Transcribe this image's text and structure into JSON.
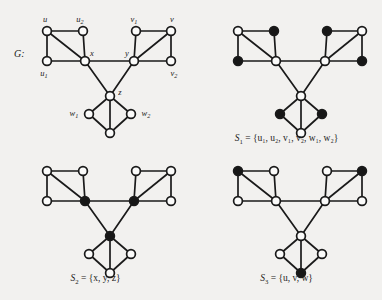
{
  "figure": {
    "background_color": "#f2f1ef",
    "ink_color": "#1a1a1a",
    "open_node_color": "#fbfbfa",
    "filled_node_color": "#171717"
  },
  "panels": {
    "G": {
      "label": "G:",
      "vertex_labels": {
        "u": "u",
        "u1_base": "u",
        "u1_sub": "1",
        "u2_base": "u",
        "u2_sub": "2",
        "v": "v",
        "v1_base": "v",
        "v1_sub": "1",
        "v2_base": "v",
        "v2_sub": "2",
        "x": "x",
        "y": "y",
        "z": "z",
        "w": "w",
        "w1_base": "w",
        "w1_sub": "1",
        "w2_base": "w",
        "w2_sub": "2"
      },
      "filled_vertices": []
    },
    "S1": {
      "caption_name": "S",
      "caption_sub": "1",
      "caption_set": " = {u₁, u₂, v₁, v₂, w₁, w₂}",
      "caption_plain": "S1 = {u1, u2, v1, v2, w1, w2}",
      "filled_vertices": [
        "u1",
        "u2",
        "v1",
        "v2",
        "w1",
        "w2"
      ]
    },
    "S2": {
      "caption_name": "S",
      "caption_sub": "2",
      "caption_set": " = {x, y, z}",
      "caption_plain": "S2 = {x, y, z}",
      "filled_vertices": [
        "x",
        "y",
        "z"
      ]
    },
    "S3": {
      "caption_name": "S",
      "caption_sub": "3",
      "caption_set": " = {u, v, w}",
      "caption_plain": "S3 = {u, v, w}",
      "filled_vertices": [
        "u",
        "v",
        "w"
      ]
    }
  },
  "graph": {
    "vertices": [
      "u",
      "u1",
      "u2",
      "x",
      "v",
      "v1",
      "v2",
      "y",
      "z",
      "w",
      "w1",
      "w2"
    ],
    "edges": [
      [
        "u",
        "u2"
      ],
      [
        "u",
        "u1"
      ],
      [
        "u",
        "x"
      ],
      [
        "u2",
        "x"
      ],
      [
        "u1",
        "x"
      ],
      [
        "v1",
        "v"
      ],
      [
        "v1",
        "y"
      ],
      [
        "y",
        "v"
      ],
      [
        "y",
        "v2"
      ],
      [
        "v",
        "v2"
      ],
      [
        "x",
        "y"
      ],
      [
        "x",
        "z"
      ],
      [
        "y",
        "z"
      ],
      [
        "z",
        "w1"
      ],
      [
        "z",
        "w2"
      ],
      [
        "z",
        "w"
      ],
      [
        "w1",
        "w"
      ],
      [
        "w2",
        "w"
      ]
    ]
  }
}
